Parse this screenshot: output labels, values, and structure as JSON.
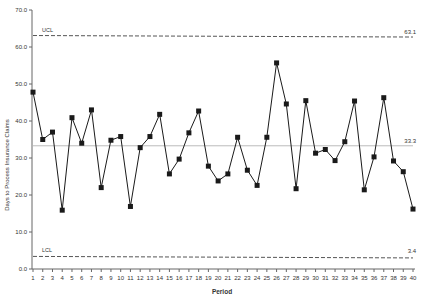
{
  "chart_data": {
    "type": "line",
    "title": "",
    "xlabel": "Period",
    "ylabel": "Days to Process Insurance Claims",
    "ylim": [
      0,
      70
    ],
    "yticks": [
      "0.0",
      "10.0",
      "20.0",
      "30.0",
      "40.0",
      "50.0",
      "60.0",
      "70.0"
    ],
    "x": [
      1,
      2,
      3,
      4,
      5,
      6,
      7,
      8,
      9,
      10,
      11,
      12,
      13,
      14,
      15,
      16,
      17,
      18,
      19,
      20,
      21,
      22,
      23,
      24,
      25,
      26,
      27,
      28,
      29,
      30,
      31,
      32,
      33,
      34,
      35,
      36,
      37,
      38,
      39,
      40
    ],
    "series": [
      {
        "name": "Days to Process Insurance Claims",
        "values": [
          47.8,
          35.0,
          37.0,
          15.9,
          40.9,
          34.0,
          43.0,
          22.0,
          34.8,
          35.8,
          16.9,
          32.8,
          35.8,
          41.8,
          25.7,
          29.7,
          36.8,
          42.7,
          27.8,
          23.8,
          25.7,
          35.6,
          26.7,
          22.6,
          35.6,
          55.7,
          44.6,
          21.7,
          45.5,
          31.3,
          32.3,
          29.3,
          34.4,
          45.4,
          21.4,
          30.3,
          46.3,
          29.2,
          26.3,
          16.2
        ]
      }
    ],
    "control_limits": {
      "ucl": {
        "label": "UCL",
        "value": 63.1,
        "value_label": "63.1"
      },
      "cl": {
        "label": "",
        "value": 33.3,
        "value_label": "33.3"
      },
      "lcl": {
        "label": "LCL",
        "value": 3.4,
        "value_label": "3.4"
      }
    },
    "grid": false,
    "legend": "none"
  },
  "colors": {
    "series": "#1a1a1a",
    "limit_lines": "#555555",
    "center_line": "#bbbbbb",
    "axis": "#666666"
  }
}
